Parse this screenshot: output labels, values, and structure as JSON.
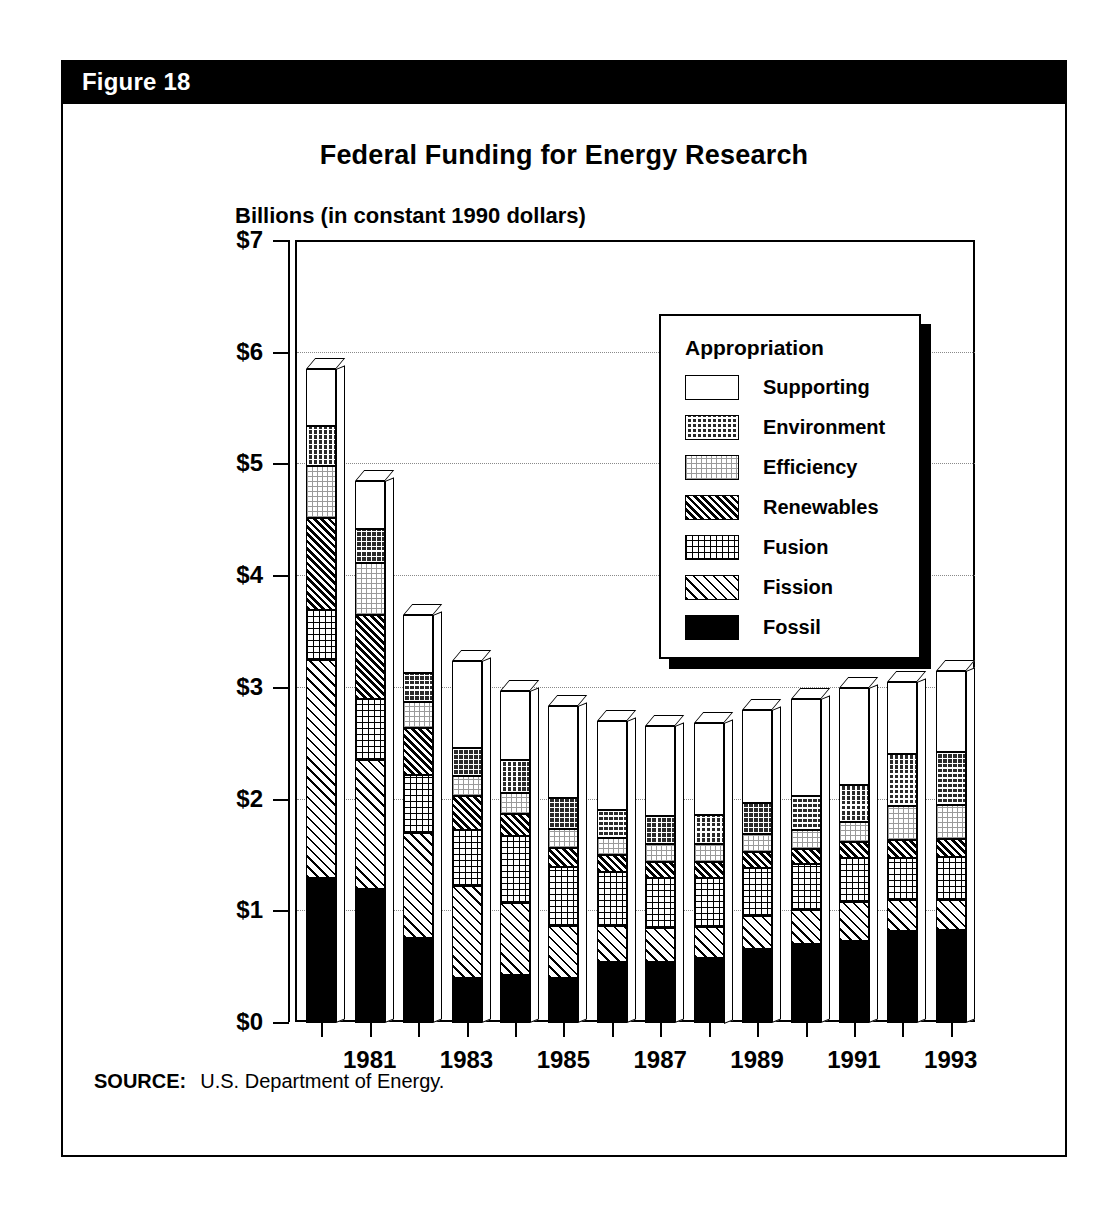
{
  "figure": {
    "header_label": "Figure 18",
    "title": "Federal Funding for Energy Research",
    "y_axis_caption": "Billions (in constant 1990 dollars)",
    "source_label": "SOURCE:",
    "source_text": "U.S. Department of Energy."
  },
  "legend": {
    "title": "Appropriation",
    "items": [
      {
        "label": "Supporting",
        "pattern": "solid-white"
      },
      {
        "label": "Environment",
        "pattern": "dark-checker"
      },
      {
        "label": "Efficiency",
        "pattern": "light-dots"
      },
      {
        "label": "Renewables",
        "pattern": "dense-diagonal"
      },
      {
        "label": "Fusion",
        "pattern": "grid-dots"
      },
      {
        "label": "Fission",
        "pattern": "wide-diagonal"
      },
      {
        "label": "Fossil",
        "pattern": "solid-black"
      }
    ]
  },
  "colors": {
    "ink": "#000000",
    "paper": "#ffffff",
    "grid": "#8a8a8a"
  },
  "chart_data": {
    "type": "bar",
    "subtype": "stacked-3d",
    "title": "Federal Funding for Energy Research",
    "xlabel": "",
    "ylabel": "Billions (in constant 1990 dollars)",
    "ylim": [
      0,
      7
    ],
    "ytick_labels": [
      "$0",
      "$1",
      "$2",
      "$3",
      "$4",
      "$5",
      "$6",
      "$7"
    ],
    "ytick_values": [
      0,
      1,
      2,
      3,
      4,
      5,
      6,
      7
    ],
    "grid": true,
    "legend_position": "inside-top-right",
    "categories": [
      1980,
      1981,
      1982,
      1983,
      1984,
      1985,
      1986,
      1987,
      1988,
      1989,
      1990,
      1991,
      1992,
      1993
    ],
    "xtick_labels_shown": [
      "1981",
      "1983",
      "1985",
      "1987",
      "1989",
      "1991",
      "1993"
    ],
    "stack_order_bottom_to_top": [
      "Fossil",
      "Fission",
      "Fusion",
      "Renewables",
      "Efficiency",
      "Environment",
      "Supporting"
    ],
    "series": [
      {
        "name": "Fossil",
        "values": [
          1.3,
          1.2,
          0.76,
          0.4,
          0.43,
          0.4,
          0.55,
          0.55,
          0.58,
          0.66,
          0.71,
          0.73,
          0.82,
          0.83
        ]
      },
      {
        "name": "Fission",
        "values": [
          1.95,
          1.15,
          0.94,
          0.83,
          0.64,
          0.47,
          0.32,
          0.3,
          0.28,
          0.3,
          0.3,
          0.35,
          0.28,
          0.27
        ]
      },
      {
        "name": "Fusion",
        "values": [
          0.45,
          0.55,
          0.52,
          0.5,
          0.6,
          0.53,
          0.48,
          0.45,
          0.44,
          0.43,
          0.41,
          0.4,
          0.38,
          0.39
        ]
      },
      {
        "name": "Renewables",
        "values": [
          0.82,
          0.75,
          0.42,
          0.3,
          0.2,
          0.17,
          0.15,
          0.14,
          0.14,
          0.14,
          0.14,
          0.14,
          0.16,
          0.16
        ]
      },
      {
        "name": "Efficiency",
        "values": [
          0.47,
          0.47,
          0.23,
          0.18,
          0.19,
          0.17,
          0.16,
          0.16,
          0.16,
          0.16,
          0.17,
          0.18,
          0.3,
          0.3
        ]
      },
      {
        "name": "Environment",
        "values": [
          0.35,
          0.3,
          0.26,
          0.25,
          0.29,
          0.27,
          0.25,
          0.25,
          0.26,
          0.28,
          0.3,
          0.33,
          0.47,
          0.48
        ]
      },
      {
        "name": "Supporting",
        "values": [
          0.51,
          0.43,
          0.52,
          0.78,
          0.62,
          0.83,
          0.79,
          0.81,
          0.83,
          0.83,
          0.87,
          0.87,
          0.64,
          0.72
        ]
      }
    ],
    "totals": [
      5.85,
      4.85,
      3.65,
      3.24,
      2.97,
      2.84,
      2.7,
      2.66,
      2.69,
      2.8,
      2.9,
      3.0,
      3.05,
      3.15
    ]
  }
}
